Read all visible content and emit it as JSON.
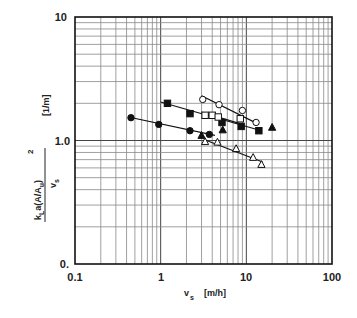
{
  "chart_data": {
    "type": "scatter",
    "title": "",
    "xlabel": "v_s  [m/h]",
    "ylabel": "k_L a (A/A_u)^2 / v_s   [1/m]",
    "xscale": "log",
    "yscale": "log",
    "xlim": [
      0.1,
      100
    ],
    "ylim": [
      0.1,
      10
    ],
    "grid": true,
    "x_tick_labels": [
      "0.1",
      "1",
      "10",
      "100"
    ],
    "y_tick_labels": [
      "0.",
      "1.0",
      "10"
    ],
    "legend": "none",
    "series": [
      {
        "name": "filled-circle",
        "marker": "circle-filled",
        "x": [
          0.45,
          0.95,
          2.2,
          3.7
        ],
        "y": [
          1.53,
          1.35,
          1.2,
          1.12
        ],
        "fit": {
          "x": [
            0.42,
            4.3
          ],
          "y": [
            1.55,
            1.1
          ]
        }
      },
      {
        "name": "filled-square",
        "marker": "square-filled",
        "x": [
          1.2,
          2.2,
          5.2,
          8.7,
          14
        ],
        "y": [
          2.0,
          1.65,
          1.4,
          1.3,
          1.2
        ],
        "fit": {
          "x": [
            1.0,
            15
          ],
          "y": [
            2.05,
            1.2
          ]
        }
      },
      {
        "name": "open-circle",
        "marker": "circle-open",
        "x": [
          3.1,
          4.8,
          9.0,
          13
        ],
        "y": [
          2.15,
          1.95,
          1.75,
          1.4
        ],
        "fit": {
          "x": [
            3.0,
            14
          ],
          "y": [
            2.3,
            1.35
          ]
        }
      },
      {
        "name": "open-square",
        "marker": "square-open",
        "x": [
          3.3,
          4.0,
          4.7,
          8.5
        ],
        "y": [
          1.6,
          1.6,
          1.55,
          1.5
        ],
        "fit": {
          "x": [
            3.0,
            9
          ],
          "y": [
            1.7,
            1.35
          ]
        }
      },
      {
        "name": "filled-triangle",
        "marker": "triangle-filled",
        "x": [
          3.0,
          5.3,
          20
        ],
        "y": [
          1.1,
          1.22,
          1.28
        ]
      },
      {
        "name": "open-triangle",
        "marker": "triangle-open",
        "x": [
          3.3,
          4.6,
          7.6,
          12,
          15
        ],
        "y": [
          0.98,
          0.97,
          0.86,
          0.73,
          0.64
        ],
        "fit": {
          "x": [
            3.2,
            15.5
          ],
          "y": [
            1.02,
            0.67
          ]
        }
      }
    ]
  },
  "axes": {
    "x_label_main": "v",
    "x_label_sub": "s",
    "x_label_unit": "[m/h]",
    "y_label_num": "k",
    "y_label_num_sub": "L",
    "y_label_num_rest": "a(A/A",
    "y_label_num_sub2": "u",
    "y_label_num_close": ")",
    "y_label_sup": "2",
    "y_label_den": "v",
    "y_label_den_sub": "s",
    "y_label_unit": "[1/m]",
    "x_ticks": [
      "0.1",
      "1",
      "10",
      "100"
    ],
    "y_ticks": [
      "0.",
      "1.0",
      "10"
    ]
  }
}
